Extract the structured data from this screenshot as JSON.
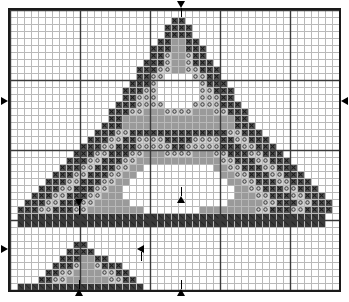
{
  "document": {
    "kind": "counted-cross-stitch-pattern-chart",
    "title": "Pyramid Motif Cross-Stitch Chart",
    "background_color": "#ffffff",
    "border_color": "#1a1a1a"
  },
  "grid": {
    "columns": 47,
    "rows": 40,
    "cell_size_px": 7,
    "minor_line_color": "#b9b9b9",
    "major_line_color": "#3a3a3a",
    "major_every": 10,
    "frame_left_px": 8,
    "frame_top_px": 8,
    "frame_width_px": 333,
    "frame_height_px": 286
  },
  "legend": {
    "symbols": [
      {
        "key": "X",
        "name": "cross-dark",
        "label": "X",
        "fill": "#565656",
        "glyph": "x",
        "glyph_color": "#101010"
      },
      {
        "key": "M",
        "name": "solid-mid",
        "label": "M",
        "fill": "#9a9a9a",
        "glyph": "",
        "glyph_color": "#000000"
      },
      {
        "key": "L",
        "name": "dot-light",
        "label": "L",
        "fill": "#cfcfcf",
        "glyph": "o",
        "glyph_color": "#3a3a3a"
      },
      {
        "key": "K",
        "name": "solid-dark",
        "label": "K",
        "fill": "#3b3b3b",
        "glyph": "",
        "glyph_color": "#000000"
      },
      {
        "key": ".",
        "name": "empty",
        "label": "",
        "fill": "#ffffff",
        "glyph": "",
        "glyph_color": "#000000"
      }
    ]
  },
  "center_markers": [
    {
      "name": "center-marker-top",
      "side": "top",
      "direction": "down",
      "x_px": 177,
      "y_px": 1
    },
    {
      "name": "center-marker-left-upper",
      "side": "left",
      "direction": "right",
      "x_px": 1,
      "y_px": 97
    },
    {
      "name": "center-marker-right-upper",
      "side": "right",
      "direction": "left",
      "x_px": 341,
      "y_px": 97
    },
    {
      "name": "center-marker-left-lower",
      "side": "left",
      "direction": "right",
      "x_px": 1,
      "y_px": 245
    },
    {
      "name": "center-marker-inner-lower",
      "side": "inner",
      "direction": "left",
      "x_px": 137,
      "y_px": 245
    },
    {
      "name": "center-marker-bottom-small",
      "side": "bottom",
      "direction": "up",
      "x_px": 75,
      "y_px": 289
    },
    {
      "name": "center-marker-bottom-main",
      "side": "bottom",
      "direction": "up",
      "x_px": 177,
      "y_px": 289
    },
    {
      "name": "center-marker-mid-small",
      "side": "inner",
      "direction": "down",
      "x_px": 75,
      "y_px": 199
    },
    {
      "name": "center-marker-mid-main",
      "side": "inner",
      "direction": "up",
      "x_px": 177,
      "y_px": 196
    }
  ],
  "chart_data": {
    "type": "heatmap",
    "title": "Pyramid Motif Cross-Stitch Chart",
    "xlabel": "",
    "ylabel": "",
    "legend_position": "none",
    "grid": true,
    "columns": 47,
    "rows": 40,
    "palette": {
      "X": "#565656",
      "M": "#9a9a9a",
      "L": "#cfcfcf",
      "K": "#3b3b3b",
      ".": "#ffffff"
    },
    "cells": [
      "...............................................",
      ".......................XX......................",
      "......................XXXX.....................",
      "......................XXXX.....................",
      ".....................XXMMXX....................",
      "....................XXXMMXXX...................",
      "....................XXLMMLXX...................",
      "...................XXXLMMLXXX..................",
      "..................XXXLLMMLLXXX.................",
      "..................XXLL....LLXX.................",
      ".................XXXL......LXXX................",
      "................XXXLL......LLXXX...............",
      "................XXLLL......LLLXX...............",
      "...............XXXLLLL....LLLLXXX..............",
      "..............XXXLLMMMLLLLMMMLLXXX.............",
      "..............XXMMMMMMMMMMMMMMMMXX.............",
      ".............XXXMMMMMMMMMMMMMMMMXXX............",
      "............XXXLLXXXXXXXXXXXXXXLLXXX...........",
      "...........XXXLLXXLLLLXXXXLLLLXXLLXXX..........",
      "..........XXXLLXXXLLLLLXXLLLLLXXXLLXXX.........",
      ".........XXXLLXXXLLMMMLLLLMMMLLXXXLLXXX........",
      "........XXXLLXXXLLMMMMMMMMMMMMLLXXXLLXXX.......",
      ".......XXXLLXXXLLMM..........MMLLXXXLLXXX......",
      "......XXXLLXXXLLMM............MMLLXXXLLXXX.....",
      ".....XXXLLXXXLLMM..............MMLLXXXLLXXX....",
      "....XXXLLXXXLLMM................MMLLXXXLLXXX...",
      "...XXXLLXXXLLMMM................MMMLLXXXLLXXX..",
      "..XXXLLXXXLLMMMMM..............MMMMMLLXXXLLXXX.",
      ".XXXLLXXXLLMMMMMMMM........MMMMMMMMLLXXXLLXXXX.",
      ".KKKKKKKKKKKKKKKKKKKKKKKKKKKKKKKKKKKKKKKKKKKK.",
      ".KKKKKKKKKKKKKKKKKKKKKKKKKKKKKKKKKKKKKKKKKKKK.",
      "...............................................",
      "...............................................",
      ".........XX....................................",
      "........XXXX...................................",
      ".......XXXMMXX.................................",
      "......XXXLMMLXXX...............................",
      ".....XXLLMMMMLLXX..............................",
      "....XXLLMMMMMMLLXX.............................",
      ".KKKKKKKKKKKKKKKKKK............................"
    ]
  }
}
